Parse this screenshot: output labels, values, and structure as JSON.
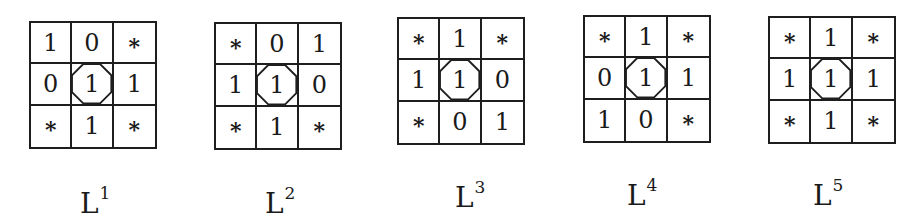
{
  "figures": [
    {
      "label": "L",
      "superscript": "1",
      "grid": [
        [
          "1",
          "0",
          "*"
        ],
        [
          "0",
          "1",
          "1"
        ],
        [
          "*",
          "1",
          "*"
        ]
      ]
    },
    {
      "label": "L",
      "superscript": "2",
      "grid": [
        [
          "*",
          "0",
          "1"
        ],
        [
          "1",
          "1",
          "0"
        ],
        [
          "*",
          "1",
          "*"
        ]
      ]
    },
    {
      "label": "L",
      "superscript": "3",
      "grid": [
        [
          "*",
          "1",
          "*"
        ],
        [
          "1",
          "1",
          "0"
        ],
        [
          "*",
          "0",
          "1"
        ]
      ]
    },
    {
      "label": "L",
      "superscript": "4",
      "grid": [
        [
          "*",
          "1",
          "*"
        ],
        [
          "0",
          "1",
          "1"
        ],
        [
          "1",
          "0",
          "*"
        ]
      ]
    },
    {
      "label": "L",
      "superscript": "5",
      "grid": [
        [
          "*",
          "1",
          "*"
        ],
        [
          "1",
          "1",
          "1"
        ],
        [
          "*",
          "1",
          "*"
        ]
      ]
    }
  ],
  "colors": {
    "ink": "#1e1e1e",
    "background": "#ffffff"
  },
  "center_marker": "octagon"
}
